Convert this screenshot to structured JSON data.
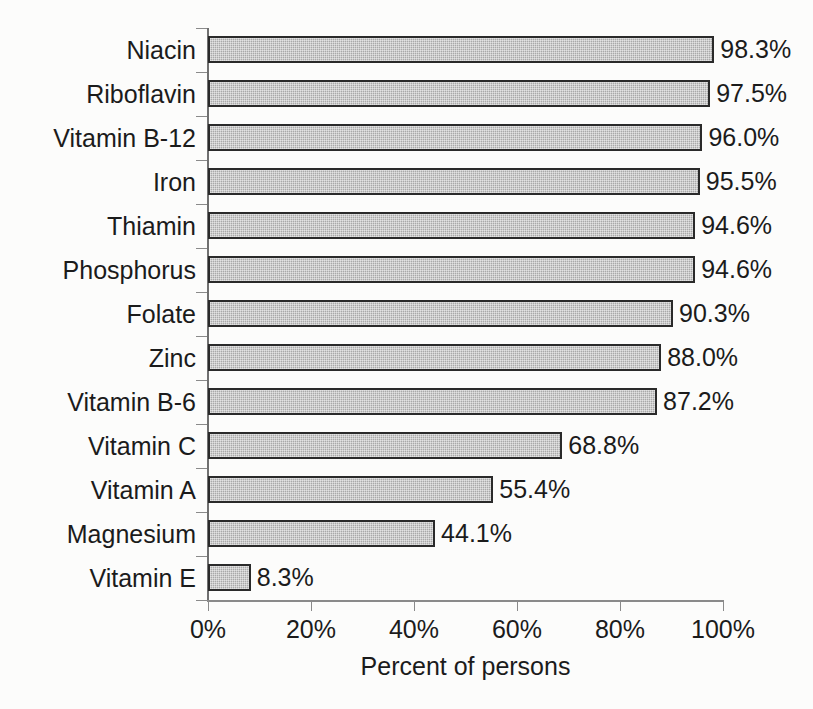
{
  "chart_data": {
    "type": "bar",
    "orientation": "horizontal",
    "title": "",
    "xlabel": "Percent of persons",
    "ylabel": "",
    "xlim": [
      0,
      100
    ],
    "xticks": [
      "0%",
      "20%",
      "40%",
      "60%",
      "80%",
      "100%"
    ],
    "xtick_values": [
      0,
      20,
      40,
      60,
      80,
      100
    ],
    "grid": false,
    "legend": null,
    "categories": [
      "Niacin",
      "Riboflavin",
      "Vitamin B-12",
      "Iron",
      "Thiamin",
      "Phosphorus",
      "Folate",
      "Zinc",
      "Vitamin B-6",
      "Vitamin C",
      "Vitamin A",
      "Magnesium",
      "Vitamin E"
    ],
    "values": [
      98.3,
      97.5,
      96.0,
      95.5,
      94.6,
      94.6,
      90.3,
      88.0,
      87.2,
      68.8,
      55.4,
      44.1,
      8.3
    ],
    "data_labels": [
      "98.3%",
      "97.5%",
      "96.0%",
      "95.5%",
      "94.6%",
      "94.6%",
      "90.3%",
      "88.0%",
      "87.2%",
      "68.8%",
      "55.4%",
      "44.1%",
      "8.3%"
    ],
    "colors": {
      "bar_fill": "#a9a9a9",
      "bar_border": "#2a2a2a",
      "axis": "#8a8a8a",
      "text": "#1b1b1b",
      "background": "#fcfcfb"
    }
  }
}
